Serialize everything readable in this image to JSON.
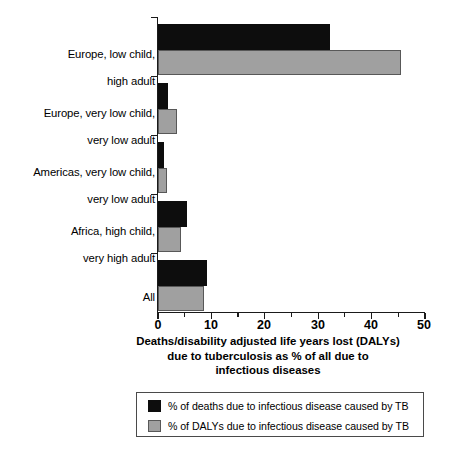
{
  "chart_data": {
    "type": "bar",
    "orientation": "horizontal",
    "title": "",
    "xlabel": "Deaths/disability adjusted life years lost (DALYs)\ndue to tuberculosis as % of all due to\ninfectious diseases",
    "ylabel": "",
    "xlim": [
      0,
      50
    ],
    "xticks": [
      0,
      10,
      20,
      30,
      40,
      50
    ],
    "xtick_labels": [
      "0",
      "10",
      "20",
      "30",
      "40",
      "50"
    ],
    "xticks_minor": [
      5,
      15,
      25,
      35,
      45
    ],
    "grid": false,
    "legend_position": "below-plot",
    "categories": [
      "Europe, low child,\nhigh adult",
      "Europe, very low child,\nvery low adult",
      "Americas, very low child,\nvery low adult",
      "Africa, high child,\nvery high adult",
      "All"
    ],
    "series": [
      {
        "name": "% of deaths due to infectious disease caused by TB",
        "color": "#0d0d0d",
        "values": [
          32.3,
          1.8,
          1.2,
          5.5,
          9.1
        ]
      },
      {
        "name": "% of DALYs due to infectious disease caused by TB",
        "color": "#a0a0a0",
        "values": [
          45.5,
          3.6,
          1.7,
          4.3,
          8.7
        ]
      }
    ]
  },
  "axis_title": {
    "line1": "Deaths/disability adjusted life years lost (DALYs)",
    "line2": "due to tuberculosis as % of all due to",
    "line3": "infectious diseases"
  },
  "category_labels": [
    {
      "line1": "Europe, low child,",
      "line2": "high adult"
    },
    {
      "line1": "Europe, very low child,",
      "line2": "very low adult"
    },
    {
      "line1": "Americas, very low child,",
      "line2": "very low adult"
    },
    {
      "line1": "Africa, high child,",
      "line2": "very high adult"
    },
    {
      "line1": "All",
      "line2": ""
    }
  ],
  "tick_labels": [
    "0",
    "10",
    "20",
    "30",
    "40",
    "50"
  ],
  "legend": {
    "entries": [
      {
        "label": "% of deaths due to infectious disease caused by TB",
        "color": "#0d0d0d",
        "swatch": "black-square-swatch"
      },
      {
        "label": "% of DALYs due to infectious disease caused by TB",
        "color": "#a0a0a0",
        "swatch": "gray-square-swatch"
      }
    ]
  }
}
